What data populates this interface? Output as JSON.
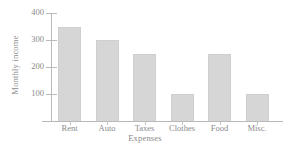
{
  "chart_data": {
    "type": "bar",
    "title": "",
    "xlabel": "Expenses",
    "ylabel": "Monthly income",
    "categories": [
      "Rent",
      "Auto",
      "Taxes",
      "Clothes",
      "Food",
      "Misc."
    ],
    "values": [
      350,
      300,
      250,
      100,
      250,
      100
    ],
    "ylim": [
      0,
      400
    ],
    "yticks": [
      100,
      200,
      300,
      400
    ],
    "ytick_labels": [
      "100",
      "200",
      "300",
      "400"
    ],
    "grid": false,
    "legend": false,
    "bar_color": "#d6d6d6",
    "bar_edge_color": "#cfcfcf",
    "axis_color": "#b9b9b9",
    "text_color": "#8a8a8a"
  }
}
